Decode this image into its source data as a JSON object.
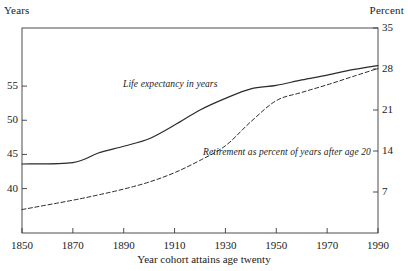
{
  "chart_data": {
    "type": "line",
    "title": "",
    "xlabel": "Year cohort attains age twenty",
    "left_axis": {
      "unit_label": "Years",
      "ticks": [
        40,
        45,
        50,
        55
      ],
      "tick_labels": [
        "40",
        "45",
        "50",
        "55"
      ],
      "ylim": [
        33.5,
        63.5
      ]
    },
    "right_axis": {
      "unit_label": "Percent",
      "ticks": [
        7,
        14,
        21,
        28,
        35
      ],
      "tick_labels": [
        "7",
        "14",
        "21",
        "28",
        "35"
      ],
      "ylim": [
        0,
        35
      ]
    },
    "x": [
      1850,
      1870,
      1880,
      1890,
      1900,
      1910,
      1920,
      1930,
      1940,
      1950,
      1960,
      1970,
      1980,
      1990
    ],
    "xlim": [
      1850,
      1990
    ],
    "xticks": [
      1850,
      1870,
      1890,
      1910,
      1930,
      1950,
      1970,
      1990
    ],
    "xtick_labels": [
      "1850",
      "1870",
      "1890",
      "1910",
      "1930",
      "1950",
      "1970",
      "1990"
    ],
    "grid": false,
    "legend_position": "inline-annotations",
    "series": [
      {
        "name": "Life expectancy in years",
        "axis": "left",
        "style": "solid",
        "color": "#2b2b2b",
        "annotation": "Life expectancy in years",
        "values": [
          43.6,
          43.8,
          45.2,
          46.2,
          47.3,
          49.3,
          51.5,
          53.2,
          54.6,
          55.1,
          55.9,
          56.6,
          57.4,
          58.0
        ]
      },
      {
        "name": "Retirement as percent of years after age 20",
        "axis": "right",
        "style": "dashed",
        "color": "#2b2b2b",
        "annotation": "Retirement as percent of years after age 20",
        "values": [
          4.0,
          5.6,
          6.5,
          7.5,
          8.7,
          10.3,
          12.4,
          14.9,
          19.0,
          22.6,
          24.0,
          25.3,
          26.7,
          28.1
        ]
      }
    ]
  },
  "annotations": {
    "life_expectancy": "Life expectancy in years",
    "retirement": "Retirement as percent of years after age 20"
  },
  "axis_titles": {
    "x": "Year cohort attains age twenty",
    "left_unit": "Years",
    "right_unit": "Percent"
  }
}
